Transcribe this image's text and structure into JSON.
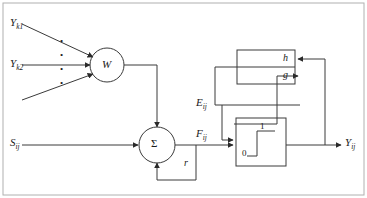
{
  "diagram": {
    "stroke_color": "#3a3a3a",
    "text_color": "#1a1a1a",
    "background": "#ffffff",
    "border_color": "#9a9a9a"
  },
  "inputs": {
    "feeding_1": {
      "base": "Y",
      "sub": "k1"
    },
    "feeding_2": {
      "base": "Y",
      "sub": "k2"
    },
    "stimulus": {
      "base": "S",
      "sub": "ij"
    },
    "vertical_dots": "•"
  },
  "nodes": {
    "weight": {
      "label": "W",
      "shape": "circle"
    },
    "sum": {
      "label": "Σ",
      "shape": "circle"
    },
    "feedback_gain": {
      "label": "r"
    }
  },
  "blocks": {
    "hg": {
      "top_label": "h",
      "bottom_label": "g",
      "shape": "rect-split"
    },
    "threshold": {
      "low_label": "0",
      "high_label": "1",
      "shape": "step-function"
    }
  },
  "signals": {
    "internal_activity": {
      "base": "F",
      "sub": "ij"
    },
    "dynamic_threshold": {
      "base": "E",
      "sub": "ij"
    },
    "output": {
      "base": "Y",
      "sub": "ij"
    }
  }
}
